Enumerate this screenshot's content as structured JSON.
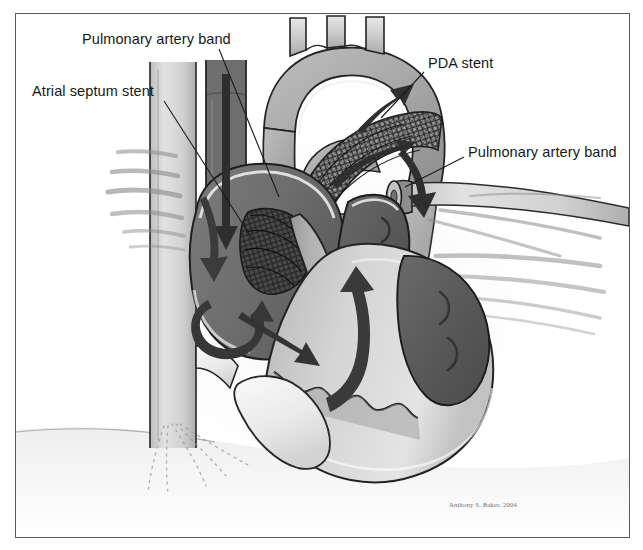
{
  "figure": {
    "medium": "grayscale medical line illustration",
    "artist_credit": "Anthony S. Baker, 2004",
    "border_color": "#5a5a5a",
    "background_color": "#ffffff"
  },
  "labels": [
    {
      "id": "pa-band-left",
      "text": "Pulmonary artery band",
      "x": 82,
      "y": 32,
      "leader_from": [
        218,
        48
      ],
      "leader_to": [
        278,
        196
      ]
    },
    {
      "id": "atrial-septum-stent",
      "text": "Atrial septum stent",
      "x": 32,
      "y": 84,
      "leader_from": [
        163,
        100
      ],
      "leader_to": [
        252,
        239
      ]
    },
    {
      "id": "pda-stent",
      "text": "PDA stent",
      "x": 428,
      "y": 56,
      "leader_from": [
        424,
        72
      ],
      "leader_to": [
        382,
        117
      ]
    },
    {
      "id": "pa-band-right",
      "text": "Pulmonary artery band",
      "x": 468,
      "y": 145,
      "leader_from": [
        463,
        156
      ],
      "leader_to": [
        406,
        186
      ]
    }
  ],
  "palette": {
    "ink": "#171717",
    "outline": "#2b2b2b",
    "myocardium_mid": "#a9a9a9",
    "myocardium_light": "#c9c9c9",
    "chamber_dark": "#5e5e5e",
    "chamber_darker": "#4a4a4a",
    "vessel_light": "#d8d8d8",
    "vessel_pale": "#ececec",
    "blood_pool_light": "#ededed",
    "arrow_dark": "#3d3d3d",
    "stent_mesh": "#1d1d1d",
    "shadow": "#8d8d8d",
    "label_text": "#171717",
    "credit_text": "#70706e"
  },
  "anatomy": {
    "structures": [
      "aortic arch with three brachiocephalic branch vessels",
      "ascending aorta",
      "descending aorta",
      "main pulmonary artery / trunk",
      "right pulmonary artery (banded)",
      "left pulmonary artery (banded)",
      "patent ductus arteriosus containing stent",
      "superior vena cava",
      "inferior vena cava",
      "right atrium",
      "left atrium",
      "right ventricle",
      "hypoplastic left ventricle",
      "interatrial septum with stent",
      "tricuspid valve",
      "ventricular apex",
      "diaphragm shading"
    ],
    "devices": [
      {
        "name": "Atrial septum stent",
        "appearance": "cross-hatched mesh cylinder across interatrial septum"
      },
      {
        "name": "PDA stent",
        "appearance": "cross-hatched mesh tube within ductus arteriosus arching from pulmonary trunk to descending aorta"
      },
      {
        "name": "Pulmonary artery band (left)",
        "appearance": "external constricting band narrowing left pulmonary artery"
      },
      {
        "name": "Pulmonary artery band (right)",
        "appearance": "external constricting band narrowing right pulmonary artery"
      }
    ],
    "flow_arrows": [
      "right-to-left shunt across atrial septal stent",
      "systemic venous return down superior vena cava",
      "circular swirl within right atrium",
      "right atrium to right ventricle inflow",
      "right ventricular outflow upward to pulmonary trunk",
      "ductal flow into aortic arch (retrograde, upward)",
      "ductal flow into descending aorta (antegrade, downward)"
    ]
  }
}
